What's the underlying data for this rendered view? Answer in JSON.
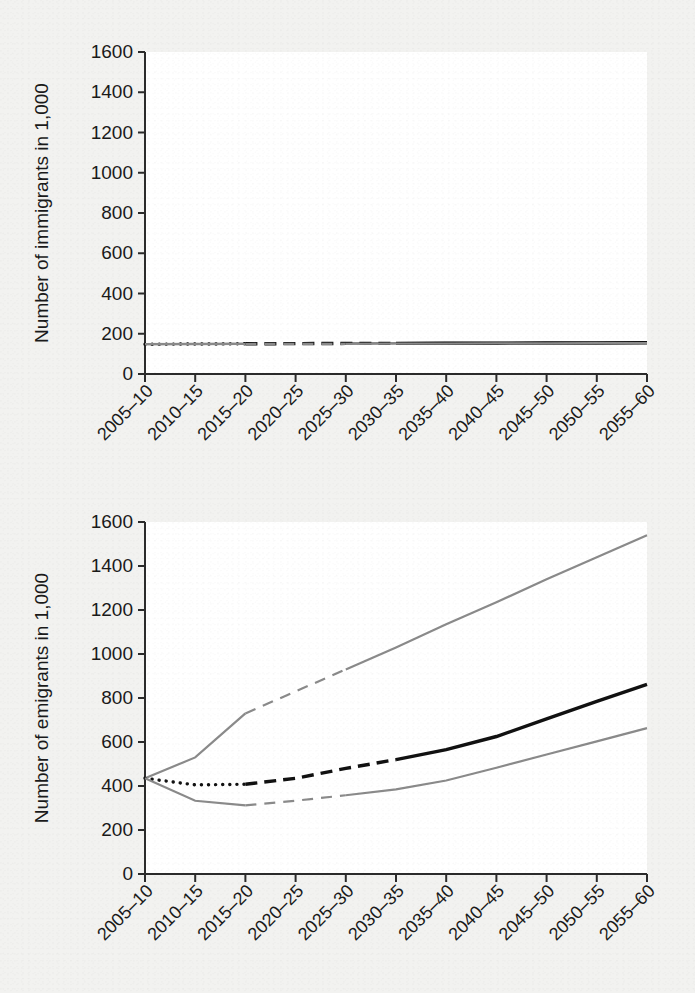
{
  "figure": {
    "background_color": "#f2f2f0",
    "plot_background_color": "#ffffff"
  },
  "colors": {
    "axis": "#2b2b2b",
    "median_line": "#111111",
    "bound_line": "#8a8a8a",
    "text": "#1a1a1a"
  },
  "chart_data": [
    {
      "type": "line",
      "panel": "top",
      "title": "",
      "xlabel": "",
      "ylabel": "Number of immigrants in 1,000",
      "ylim": [
        0,
        1600
      ],
      "yticks": [
        0,
        200,
        400,
        600,
        800,
        1000,
        1200,
        1400,
        1600
      ],
      "ytick_labels": [
        "0",
        "200",
        "400",
        "600",
        "800",
        "1000",
        "1200",
        "1400",
        "1600"
      ],
      "grid": false,
      "legend": "none",
      "categories": [
        "2005–10",
        "2010–15",
        "2015–20",
        "2020–25",
        "2025–30",
        "2030–35",
        "2035–40",
        "2040–45",
        "2045–50",
        "2050–55",
        "2055–60"
      ],
      "observed_periods": [
        "2005–10",
        "2010–15",
        "2015–20"
      ],
      "projected_periods": [
        "2020–25",
        "2025–30",
        "2030–35",
        "2035–40",
        "2040–45",
        "2045–50",
        "2050–55",
        "2055–60"
      ],
      "series": [
        {
          "name": "upper-bound",
          "style": "solid-then-dashed",
          "color": "#8a8a8a",
          "values": [
            148,
            150,
            151,
            152,
            153,
            154,
            155,
            155,
            156,
            156,
            157
          ]
        },
        {
          "name": "median",
          "style": "dotted-then-dashed-then-solid",
          "color": "#111111",
          "values": [
            148,
            149,
            150,
            151,
            152,
            152,
            153,
            153,
            154,
            154,
            155
          ]
        },
        {
          "name": "lower-bound",
          "style": "solid-then-dashed",
          "color": "#8a8a8a",
          "values": [
            148,
            148,
            149,
            150,
            150,
            151,
            151,
            152,
            152,
            153,
            153
          ]
        }
      ]
    },
    {
      "type": "line",
      "panel": "bottom",
      "title": "",
      "xlabel": "",
      "ylabel": "Number of emigrants in 1,000",
      "ylim": [
        0,
        1600
      ],
      "yticks": [
        0,
        200,
        400,
        600,
        800,
        1000,
        1200,
        1400,
        1600
      ],
      "ytick_labels": [
        "0",
        "200",
        "400",
        "600",
        "800",
        "1000",
        "1200",
        "1400",
        "1600"
      ],
      "grid": false,
      "legend": "none",
      "categories": [
        "2005–10",
        "2010–15",
        "2015–20",
        "2020–25",
        "2025–30",
        "2030–35",
        "2035–40",
        "2040–45",
        "2045–50",
        "2050–55",
        "2055–60"
      ],
      "observed_periods": [
        "2005–10",
        "2010–15",
        "2015–20"
      ],
      "projected_periods": [
        "2020–25",
        "2025–30",
        "2030–35",
        "2035–40",
        "2040–45",
        "2045–50",
        "2050–55",
        "2055–60"
      ],
      "series": [
        {
          "name": "upper-bound",
          "style": "solid-then-dashed-then-solid",
          "color": "#8a8a8a",
          "values": [
            435,
            530,
            730,
            830,
            930,
            1030,
            1135,
            1235,
            1340,
            1440,
            1540
          ]
        },
        {
          "name": "median",
          "style": "dotted-then-dashed-then-solid",
          "color": "#111111",
          "values": [
            435,
            405,
            408,
            435,
            480,
            520,
            565,
            625,
            705,
            785,
            862
          ]
        },
        {
          "name": "lower-bound",
          "style": "solid-then-dashed-then-solid",
          "color": "#8a8a8a",
          "values": [
            435,
            333,
            312,
            333,
            358,
            385,
            425,
            483,
            543,
            603,
            663
          ]
        }
      ]
    }
  ]
}
